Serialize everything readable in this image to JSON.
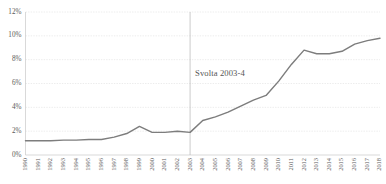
{
  "chart_data": {
    "type": "line",
    "title": "",
    "xlabel": "",
    "ylabel": "",
    "ylim": [
      0,
      12
    ],
    "yticks": [
      0,
      2,
      4,
      6,
      8,
      10,
      12
    ],
    "ytick_labels": [
      "0%",
      "2%",
      "4%",
      "6%",
      "8%",
      "10%",
      "12%"
    ],
    "grid": true,
    "legend": "none",
    "categories": [
      "1990",
      "1991",
      "1992",
      "1993",
      "1994",
      "1995",
      "1996",
      "1997",
      "1998",
      "1999",
      "2000",
      "2001",
      "2002",
      "2003",
      "2004",
      "2005",
      "2006",
      "2007",
      "2008",
      "2009",
      "2010",
      "2011",
      "2012",
      "2013",
      "2014",
      "2015",
      "2016",
      "2017",
      "2018"
    ],
    "values": [
      1.2,
      1.2,
      1.2,
      1.25,
      1.25,
      1.3,
      1.3,
      1.5,
      1.8,
      2.4,
      1.9,
      1.9,
      2.0,
      1.9,
      2.9,
      3.2,
      3.6,
      4.1,
      4.6,
      5.0,
      6.2,
      7.6,
      8.8,
      8.5,
      8.5,
      8.7,
      9.3,
      9.6,
      9.8
    ],
    "series": [
      {
        "name": "serie",
        "color": "#7d7d7d",
        "values": [
          1.2,
          1.2,
          1.2,
          1.25,
          1.25,
          1.3,
          1.3,
          1.5,
          1.8,
          2.4,
          1.9,
          1.9,
          2.0,
          1.9,
          2.9,
          3.2,
          3.6,
          4.1,
          4.6,
          5.0,
          6.2,
          7.6,
          8.8,
          8.5,
          8.5,
          8.7,
          9.3,
          9.6,
          9.8
        ]
      }
    ],
    "annotations": [
      {
        "text": "Svolta 2003-4",
        "x_category": "2003",
        "y_value": 6.6,
        "marker": "vertical-line"
      }
    ],
    "colors": {
      "series": "#7d7d7d",
      "grid": "#d9d9d9",
      "axis": "#c9c9c9",
      "marker": "#b5b5b5",
      "tick_text": "#5a5a5a",
      "annotation_text": "#555555",
      "background": "#ffffff"
    }
  }
}
